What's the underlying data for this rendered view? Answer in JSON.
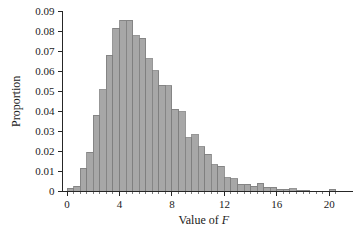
{
  "chart_data": {
    "type": "bar",
    "title": "",
    "subtitle": "",
    "xlabel_prefix": "Value of ",
    "xlabel_italic": "F",
    "ylabel": "Proportion",
    "xlim": [
      -0.35,
      21.2
    ],
    "ylim": [
      0,
      0.092
    ],
    "grid": false,
    "legend": null,
    "bin_width": 0.5,
    "bar_fill": "#a7a7a7",
    "bar_stroke": "#7d7d7d",
    "axis_color": "#262626",
    "x_ticks": [
      0,
      4,
      8,
      12,
      16,
      20
    ],
    "x_tick_labels": [
      "0",
      "4",
      "8",
      "12",
      "16",
      "20"
    ],
    "x_minor_tick_step": 0.5,
    "y_ticks": [
      0,
      0.01,
      0.02,
      0.03,
      0.04,
      0.05,
      0.06,
      0.07,
      0.08,
      0.09
    ],
    "y_tick_labels": [
      "0",
      "0.01",
      "0.02",
      "0.03",
      "0.04",
      "0.05",
      "0.06",
      "0.07",
      "0.08",
      "0.09"
    ],
    "categories": [
      0.25,
      0.75,
      1.25,
      1.75,
      2.25,
      2.75,
      3.25,
      3.75,
      4.25,
      4.75,
      5.25,
      5.75,
      6.25,
      6.75,
      7.25,
      7.75,
      8.25,
      8.75,
      9.25,
      9.75,
      10.25,
      10.75,
      11.25,
      11.75,
      12.25,
      12.75,
      13.25,
      13.75,
      14.25,
      14.75,
      15.25,
      15.75,
      16.25,
      16.75,
      17.25,
      17.75,
      18.25,
      18.75,
      19.25,
      19.75,
      20.25
    ],
    "values": [
      0.0015,
      0.0025,
      0.0115,
      0.0195,
      0.038,
      0.0508,
      0.068,
      0.0815,
      0.0853,
      0.0853,
      0.0777,
      0.0763,
      0.0662,
      0.0601,
      0.0529,
      0.0528,
      0.0411,
      0.0397,
      0.0267,
      0.0283,
      0.0224,
      0.0185,
      0.0134,
      0.0127,
      0.0068,
      0.0063,
      0.0036,
      0.0035,
      0.0027,
      0.0042,
      0.0022,
      0.0021,
      0.0012,
      0.001,
      0.0013,
      0.0007,
      0.0007,
      0.0002,
      0.0,
      0.0,
      0.0012
    ]
  }
}
